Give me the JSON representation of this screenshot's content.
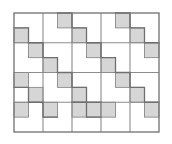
{
  "figure": {
    "type": "geometric-tiling-diagram",
    "canvas": {
      "width": 172,
      "height": 144,
      "background": "#ffffff"
    },
    "frame": {
      "x": 14,
      "y": 13,
      "width": 145,
      "height": 119,
      "stroke": "#7a7a7a",
      "stroke_width": 1.4,
      "fill": "#ffffff"
    },
    "major_grid": {
      "columns": 5,
      "rows": 4,
      "cell_width": 29,
      "cell_height": 29.75,
      "stroke": "#8c8c8c",
      "stroke_width": 1.1,
      "x_lines": [
        43,
        72,
        101,
        130
      ],
      "y_lines": [
        42.75,
        72.5,
        102.25
      ]
    },
    "sub_grid": {
      "columns": 10,
      "rows": 8,
      "cell_width": 14.5,
      "cell_height": 14.875,
      "visible": false
    },
    "shaded_cells": {
      "fill": "#d6d6d6",
      "stroke": "#8a8a8a",
      "stroke_width": 0.9,
      "count": 22,
      "note": "Coordinates are sub-grid indices [col,row], zero-based from top-left",
      "cells": [
        [
          3,
          0
        ],
        [
          7,
          0
        ],
        [
          0,
          1
        ],
        [
          4,
          1
        ],
        [
          8,
          1
        ],
        [
          1,
          2
        ],
        [
          5,
          2
        ],
        [
          9,
          2
        ],
        [
          2,
          3
        ],
        [
          6,
          3
        ],
        [
          0,
          4
        ],
        [
          3,
          4
        ],
        [
          7,
          4
        ],
        [
          1,
          5
        ],
        [
          4,
          5
        ],
        [
          8,
          5
        ],
        [
          0,
          6
        ],
        [
          2,
          6
        ],
        [
          5,
          6
        ],
        [
          6,
          6
        ],
        [
          9,
          6
        ],
        [
          4,
          6
        ]
      ]
    },
    "staircase_edges": {
      "stroke": "#6f6f6f",
      "stroke_width": 1.3,
      "note": "Polyline staircases tracing the interlocking tile boundaries, in sub-grid coordinates",
      "paths": [
        [
          [
            0,
            1
          ],
          [
            1,
            1
          ],
          [
            1,
            2
          ],
          [
            2,
            2
          ],
          [
            2,
            3
          ],
          [
            3,
            3
          ],
          [
            3,
            4
          ],
          [
            4,
            4
          ],
          [
            4,
            5
          ],
          [
            5,
            5
          ],
          [
            5,
            6
          ],
          [
            6,
            6
          ]
        ],
        [
          [
            3,
            0
          ],
          [
            4,
            0
          ],
          [
            4,
            1
          ],
          [
            5,
            1
          ],
          [
            5,
            2
          ],
          [
            6,
            2
          ],
          [
            6,
            3
          ],
          [
            7,
            3
          ],
          [
            7,
            4
          ],
          [
            8,
            4
          ],
          [
            8,
            5
          ],
          [
            9,
            5
          ],
          [
            9,
            6
          ],
          [
            10,
            6
          ]
        ],
        [
          [
            7,
            0
          ],
          [
            8,
            0
          ],
          [
            8,
            1
          ],
          [
            9,
            1
          ],
          [
            9,
            2
          ],
          [
            10,
            2
          ]
        ],
        [
          [
            0,
            5
          ],
          [
            1,
            5
          ],
          [
            1,
            6
          ],
          [
            2,
            6
          ],
          [
            2,
            7
          ],
          [
            3,
            7
          ]
        ],
        [
          [
            4,
            6
          ],
          [
            5,
            6
          ],
          [
            5,
            7
          ],
          [
            6,
            7
          ]
        ]
      ]
    },
    "empty_region": {
      "description": "Bottom major row contains no shaded cells",
      "row_index": 3
    }
  },
  "labels": {
    "caption": ""
  }
}
